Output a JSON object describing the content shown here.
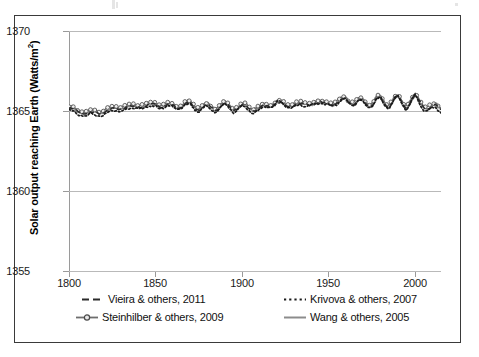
{
  "figure": {
    "frame_border_color": "#3a3a3a",
    "background": "#ffffff"
  },
  "chart_data": {
    "type": "line",
    "title": "",
    "xlabel": "",
    "ylabel": "Solar output reaching Earth (Watts/m²)",
    "ylabel_plain": "Solar output reaching Earth (Watts/m2)",
    "xlim": [
      1800,
      2015
    ],
    "ylim": [
      1355,
      1370
    ],
    "xticks": [
      1800,
      1850,
      1900,
      1950,
      2000
    ],
    "xtick_labels": [
      "1800",
      "1850",
      "1900",
      "1950",
      "2000"
    ],
    "yticks": [
      1355,
      1360,
      1365,
      1370
    ],
    "ytick_labels": [
      "1355",
      "1360",
      "1365",
      "1370"
    ],
    "grid": "horizontal",
    "legend_position": "below-axes",
    "series": [
      {
        "name": "Vieira & others, 2011",
        "style": "dashed",
        "color": "#2b2b2b",
        "x": [
          1800,
          1805,
          1810,
          1815,
          1820,
          1825,
          1830,
          1835,
          1840,
          1845,
          1850,
          1855,
          1860,
          1865,
          1870,
          1875,
          1880,
          1885,
          1890,
          1895,
          1900,
          1905,
          1910,
          1915,
          1920,
          1925,
          1930,
          1935,
          1940,
          1945,
          1950,
          1955,
          1960,
          1965,
          1970,
          1975,
          1980,
          1985,
          1990,
          1995,
          2000,
          2005,
          2010
        ],
        "values": [
          1365.2,
          1365.0,
          1364.9,
          1364.9,
          1365.0,
          1365.1,
          1365.3,
          1365.2,
          1365.4,
          1365.3,
          1365.5,
          1365.3,
          1365.4,
          1365.3,
          1365.5,
          1365.2,
          1365.3,
          1365.2,
          1365.4,
          1365.2,
          1365.3,
          1365.2,
          1365.2,
          1365.3,
          1365.6,
          1365.3,
          1365.5,
          1365.3,
          1365.6,
          1365.4,
          1365.6,
          1365.4,
          1365.9,
          1365.4,
          1365.7,
          1365.4,
          1365.8,
          1365.4,
          1365.8,
          1365.4,
          1365.8,
          1365.4,
          1365.2
        ]
      },
      {
        "name": "Krivova & others, 2007",
        "style": "dotted",
        "color": "#1a1a1a",
        "x": [
          1800,
          1805,
          1810,
          1815,
          1820,
          1825,
          1830,
          1835,
          1840,
          1845,
          1850,
          1855,
          1860,
          1865,
          1870,
          1875,
          1880,
          1885,
          1890,
          1895,
          1900,
          1905,
          1910,
          1915,
          1920,
          1925,
          1930,
          1935,
          1940,
          1945,
          1950,
          1955,
          1960,
          1965,
          1970,
          1975,
          1980,
          1985,
          1990,
          1995,
          2000,
          2005,
          2010
        ],
        "values": [
          1365.1,
          1364.9,
          1364.8,
          1364.8,
          1364.9,
          1365.0,
          1365.2,
          1365.1,
          1365.4,
          1365.2,
          1365.5,
          1365.2,
          1365.4,
          1365.2,
          1365.5,
          1365.1,
          1365.3,
          1365.1,
          1365.4,
          1365.1,
          1365.3,
          1365.1,
          1365.1,
          1365.3,
          1365.7,
          1365.3,
          1365.5,
          1365.2,
          1365.7,
          1365.3,
          1365.7,
          1365.3,
          1366.0,
          1365.3,
          1365.8,
          1365.3,
          1365.9,
          1365.3,
          1365.9,
          1365.3,
          1365.9,
          1365.3,
          1365.1
        ]
      },
      {
        "name": "Steinhilber & others, 2009",
        "style": "line-with-circle-markers",
        "color": "#6e6e6e",
        "x": [
          1800,
          1805,
          1810,
          1815,
          1820,
          1825,
          1830,
          1835,
          1840,
          1845,
          1850,
          1855,
          1860,
          1865,
          1870,
          1875,
          1880,
          1885,
          1890,
          1895,
          1900,
          1905,
          1910,
          1915,
          1920,
          1925,
          1930,
          1935,
          1940,
          1945,
          1950,
          1955,
          1960,
          1965,
          1970,
          1975,
          1980,
          1985,
          1990,
          1995,
          2000,
          2005,
          2010
        ],
        "values": [
          1365.3,
          1365.1,
          1365.0,
          1365.0,
          1365.1,
          1365.2,
          1365.4,
          1365.3,
          1365.5,
          1365.4,
          1365.6,
          1365.4,
          1365.5,
          1365.4,
          1365.6,
          1365.3,
          1365.4,
          1365.3,
          1365.5,
          1365.3,
          1365.4,
          1365.3,
          1365.3,
          1365.4,
          1365.7,
          1365.4,
          1365.6,
          1365.4,
          1365.7,
          1365.5,
          1365.7,
          1365.5,
          1366.0,
          1365.5,
          1365.8,
          1365.5,
          1365.9,
          1365.5,
          1365.9,
          1365.5,
          1365.9,
          1365.5,
          1365.3
        ]
      },
      {
        "name": "Wang & others, 2005",
        "style": "solid",
        "color": "#8c8c8c",
        "x": [
          1800,
          1805,
          1810,
          1815,
          1820,
          1825,
          1830,
          1835,
          1840,
          1845,
          1850,
          1855,
          1860,
          1865,
          1870,
          1875,
          1880,
          1885,
          1890,
          1895,
          1900,
          1905,
          1910,
          1915,
          1920,
          1925,
          1930,
          1935,
          1940,
          1945,
          1950,
          1955,
          1960,
          1965,
          1970,
          1975,
          1980,
          1985,
          1990,
          1995,
          2000,
          2005,
          2010
        ],
        "values": [
          1365.2,
          1365.0,
          1364.9,
          1364.9,
          1365.0,
          1365.1,
          1365.3,
          1365.2,
          1365.4,
          1365.3,
          1365.5,
          1365.3,
          1365.4,
          1365.3,
          1365.5,
          1365.2,
          1365.3,
          1365.2,
          1365.4,
          1365.2,
          1365.3,
          1365.2,
          1365.2,
          1365.3,
          1365.6,
          1365.3,
          1365.5,
          1365.3,
          1365.6,
          1365.4,
          1365.6,
          1365.4,
          1365.9,
          1365.4,
          1365.7,
          1365.4,
          1365.8,
          1365.4,
          1365.8,
          1365.4,
          1365.8,
          1365.4,
          1365.2
        ]
      }
    ],
    "legend": [
      {
        "label": "Vieira & others, 2011",
        "style": "dashed",
        "color": "#2b2b2b"
      },
      {
        "label": "Krivova & others, 2007",
        "style": "dotted",
        "color": "#1a1a1a"
      },
      {
        "label": "Steinhilber & others, 2009",
        "style": "line-with-circle-markers",
        "color": "#6e6e6e"
      },
      {
        "label": "Wang & others, 2005",
        "style": "solid",
        "color": "#8c8c8c"
      }
    ]
  }
}
